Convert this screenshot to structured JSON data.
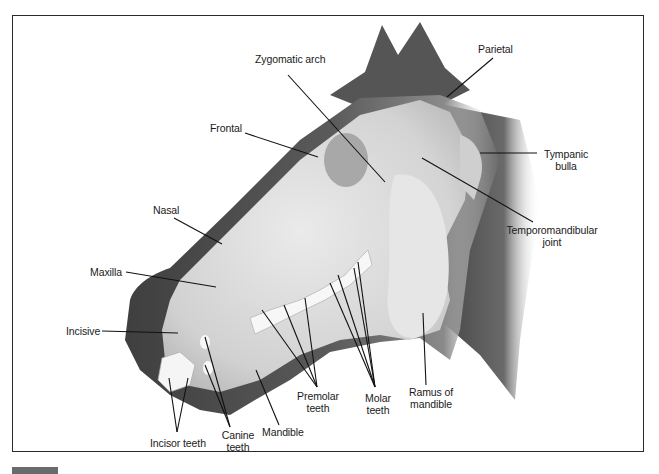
{
  "figure": {
    "labels": {
      "zygomatic_arch": "Zygomatic arch",
      "parietal": "Parietal",
      "frontal": "Frontal",
      "tympanic_bulla_1": "Tympanic",
      "tympanic_bulla_2": "bulla",
      "nasal": "Nasal",
      "temporomandibular_1": "Temporomandibular",
      "temporomandibular_2": "joint",
      "maxilla": "Maxilla",
      "incisive": "Incisive",
      "ramus_1": "Ramus of",
      "ramus_2": "mandible",
      "premolar_1": "Premolar",
      "premolar_2": "teeth",
      "molar_1": "Molar",
      "molar_2": "teeth",
      "canine_1": "Canine",
      "canine_2": "teeth",
      "mandible": "Mandible",
      "incisor_teeth": "Incisor teeth"
    }
  },
  "colors": {
    "frame": "#2a2a2a",
    "head_dark": "#4a4a4a",
    "skull": "#d9d9d9",
    "leader": "#111111"
  }
}
